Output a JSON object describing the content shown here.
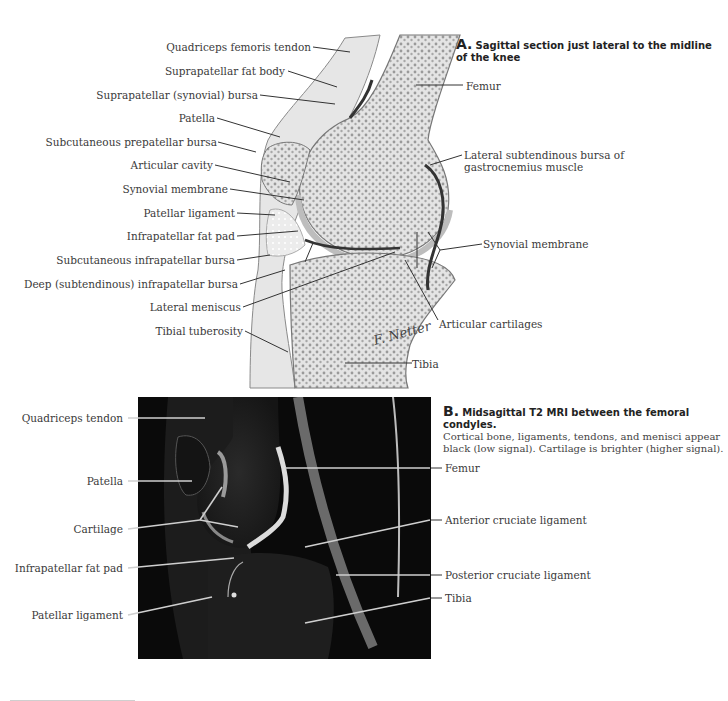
{
  "panel_a": {
    "title_prefix": "A.",
    "title_line1": "Sagittal section just lateral to the midline",
    "title_line2": "of the knee",
    "left_labels": [
      "Quadriceps femoris tendon",
      "Suprapatellar fat body",
      "Suprapatellar (synovial) bursa",
      "Patella",
      "Subcutaneous prepatellar bursa",
      "Articular cavity",
      "Synovial membrane",
      "Patellar ligament",
      "Infrapatellar fat pad",
      "Subcutaneous infrapatellar bursa",
      "Deep (subtendinous) infrapatellar bursa",
      "Lateral meniscus",
      "Tibial tuberosity"
    ],
    "right_labels": {
      "femur": "Femur",
      "lateral_bursa_line1": "Lateral subtendinous bursa of",
      "lateral_bursa_line2": "gastrocnemius muscle",
      "synovial_membrane": "Synovial membrane",
      "articular_cartilages": "Articular cartilages",
      "tibia": "Tibia"
    },
    "signature": "F. Netter"
  },
  "panel_b": {
    "title_prefix": "B.",
    "title_bold": "Midsagittal T2 MRI between the femoral condyles.",
    "desc_line1": "Cortical bone, ligaments, tendons, and menisci appear",
    "desc_line2": "black (low signal). Cartilage is brighter (higher signal).",
    "left_labels": [
      "Quadriceps tendon",
      "Patella",
      "Cartilage",
      "Infrapatellar fat pad",
      "Patellar ligament"
    ],
    "right_labels": [
      "Femur",
      "Anterior cruciate ligament",
      "Posterior cruciate ligament",
      "Tibia"
    ]
  },
  "colors": {
    "bone_fill": "#dcdcdc",
    "cartilage": "#c8c8c8",
    "leader": "#333333",
    "mri_bg": "#0a0a0a"
  }
}
